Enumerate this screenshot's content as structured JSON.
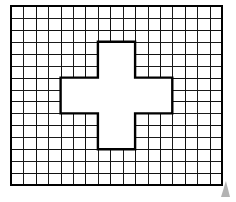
{
  "figure": {
    "type": "grid-with-cross-cutout",
    "title": "",
    "caption": "",
    "background_color": "#ffffff",
    "grid": {
      "columns": 17,
      "rows": 15,
      "x": 11,
      "y": 6,
      "width": 211,
      "height": 179,
      "cell_width": 12.41,
      "cell_height": 11.93,
      "line_color": "#1a1a1a",
      "line_width": 1,
      "border_color": "#000000",
      "border_width": 2.4,
      "fill": "none"
    },
    "cross": {
      "name": "plus-shape-cutout",
      "fill_color": "#ffffff",
      "outline_color": "#000000",
      "outline_width": 2.4,
      "bounds": {
        "x": 62,
        "y": 43,
        "width": 108,
        "height": 112
      },
      "arm_columns": [
        7,
        10
      ],
      "arm_rows": [
        6,
        9
      ],
      "span_columns": [
        4,
        13
      ],
      "span_rows": [
        3,
        12
      ],
      "points": "108,43 124,43 124,80 170,80 170,118 124,118 124,155 108,155 108,118 62,118 62,80 108,80"
    },
    "corner_mark": {
      "name": "page-corner-mark",
      "x": 221,
      "y": 181,
      "width": 9,
      "height": 16,
      "color": "#b3b3b3"
    }
  },
  "chart_data": {
    "type": "table",
    "xlabel": "",
    "ylabel": "",
    "categories": [
      "grid columns",
      "grid rows",
      "total grid cells",
      "cross cells removed",
      "remaining shaded cells"
    ],
    "values": [
      17,
      15,
      255,
      45,
      210
    ],
    "annotations": [
      "Outer rectangle: 17 columns by 15 rows of unit squares",
      "Interior white region is a plus/cross shape",
      "Cross vertical bar: 3 columns wide by 9 rows tall",
      "Cross horizontal bar: 9 columns wide by 3 rows tall",
      "Cross occupies columns 4-13 and rows 3-12 of the grid"
    ],
    "legend": [],
    "grid": true
  }
}
